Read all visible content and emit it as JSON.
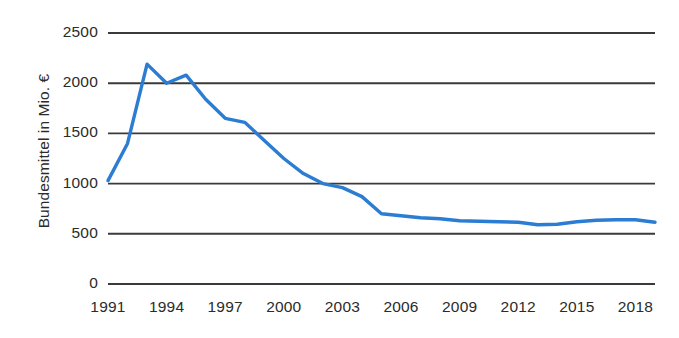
{
  "chart_data": {
    "type": "line",
    "title": "",
    "xlabel": "",
    "ylabel": "Bundesmittel in Mio. €",
    "ylim": [
      0,
      2500
    ],
    "xlim": [
      1991,
      2019
    ],
    "yticks": [
      0,
      500,
      1000,
      1500,
      2000,
      2500
    ],
    "ytick_labels": [
      "0",
      "500",
      "1000",
      "1500",
      "2000",
      "2500"
    ],
    "xticks": [
      1991,
      1994,
      1997,
      2000,
      2003,
      2006,
      2009,
      2012,
      2015,
      2018
    ],
    "xtick_labels": [
      "1991",
      "1994",
      "1997",
      "2000",
      "2003",
      "2006",
      "2009",
      "2012",
      "2015",
      "2018"
    ],
    "grid": "horizontal",
    "legend": "none",
    "series": [
      {
        "name": "Bundesmittel",
        "color": "#2b7cd3",
        "x": [
          1991,
          1992,
          1993,
          1994,
          1995,
          1996,
          1997,
          1998,
          1999,
          2000,
          2001,
          2002,
          2003,
          2004,
          2005,
          2006,
          2007,
          2008,
          2009,
          2010,
          2011,
          2012,
          2013,
          2014,
          2015,
          2016,
          2017,
          2018,
          2019
        ],
        "values": [
          1030,
          1400,
          2190,
          2000,
          2080,
          1840,
          1650,
          1610,
          1430,
          1250,
          1100,
          1000,
          960,
          870,
          700,
          680,
          660,
          650,
          630,
          625,
          620,
          615,
          590,
          595,
          620,
          635,
          640,
          640,
          615
        ]
      }
    ]
  },
  "axis": {
    "y_label": "Bundesmittel in Mio. €"
  },
  "colors": {
    "series": "#2b7cd3",
    "gridline": "#3a3a3a",
    "text": "#2b2b2b",
    "background": "#ffffff"
  }
}
